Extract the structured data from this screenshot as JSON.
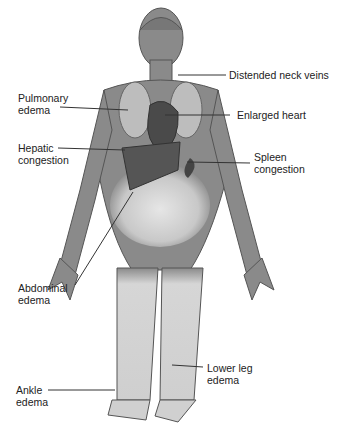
{
  "figure": {
    "labels": {
      "neck_veins": "Distended neck veins",
      "pulmonary_1": "Pulmonary",
      "pulmonary_2": "edema",
      "heart": "Enlarged heart",
      "hepatic_1": "Hepatic",
      "hepatic_2": "congestion",
      "spleen_1": "Spleen",
      "spleen_2": "congestion",
      "abdominal_1": "Abdominal",
      "abdominal_2": "edema",
      "lowerleg_1": "Lower leg",
      "lowerleg_2": "edema",
      "ankle_1": "Ankle",
      "ankle_2": "edema"
    },
    "colors": {
      "body": "#8a8a8a",
      "outline": "#555555",
      "organ": "#4a4a4a",
      "edema": "#d4d4d4",
      "text": "#222222"
    }
  }
}
